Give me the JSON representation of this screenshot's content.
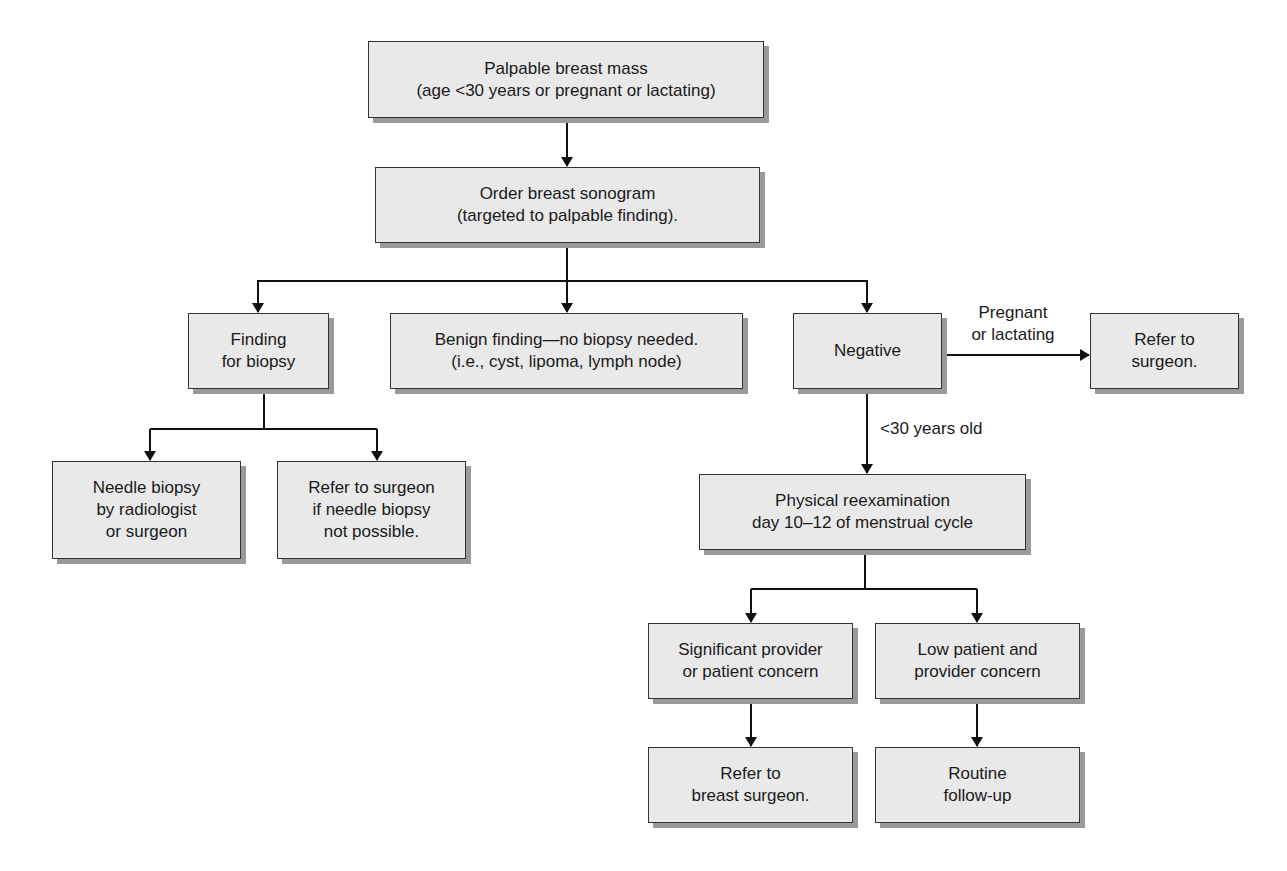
{
  "diagram": {
    "type": "flowchart",
    "colors": {
      "box_fill": "#e9e9e9",
      "box_border": "#333333",
      "shadow": "#9a9a9a",
      "line": "#111111"
    },
    "nodes": {
      "start": {
        "text": "Palpable breast mass\n(age <30 years or pregnant or lactating)"
      },
      "sonogram": {
        "text": "Order breast sonogram\n(targeted to palpable finding)."
      },
      "finding_biopsy": {
        "text": "Finding\nfor biopsy"
      },
      "benign": {
        "text": "Benign finding—no biopsy needed.\n(i.e., cyst, lipoma, lymph node)"
      },
      "negative": {
        "text": "Negative"
      },
      "refer_surgeon": {
        "text": "Refer to\nsurgeon."
      },
      "needle_biopsy": {
        "text": "Needle biopsy\nby radiologist\nor surgeon"
      },
      "refer_if_not_possible": {
        "text": "Refer to surgeon\nif needle biopsy\nnot possible."
      },
      "reexam": {
        "text": "Physical reexamination\nday 10–12 of menstrual cycle"
      },
      "significant_concern": {
        "text": "Significant provider\nor patient concern"
      },
      "low_concern": {
        "text": "Low patient and\nprovider concern"
      },
      "refer_breast_surgeon": {
        "text": "Refer to\nbreast surgeon."
      },
      "routine_followup": {
        "text": "Routine\nfollow-up"
      }
    },
    "edge_labels": {
      "pregnant_lactating": "Pregnant\nor lactating",
      "under_30": "<30 years old"
    },
    "edges": [
      [
        "start",
        "sonogram"
      ],
      [
        "sonogram",
        "finding_biopsy"
      ],
      [
        "sonogram",
        "benign"
      ],
      [
        "sonogram",
        "negative"
      ],
      [
        "negative",
        "refer_surgeon",
        "Pregnant or lactating"
      ],
      [
        "negative",
        "reexam",
        "<30 years old"
      ],
      [
        "finding_biopsy",
        "needle_biopsy"
      ],
      [
        "finding_biopsy",
        "refer_if_not_possible"
      ],
      [
        "reexam",
        "significant_concern"
      ],
      [
        "reexam",
        "low_concern"
      ],
      [
        "significant_concern",
        "refer_breast_surgeon"
      ],
      [
        "low_concern",
        "routine_followup"
      ]
    ]
  }
}
